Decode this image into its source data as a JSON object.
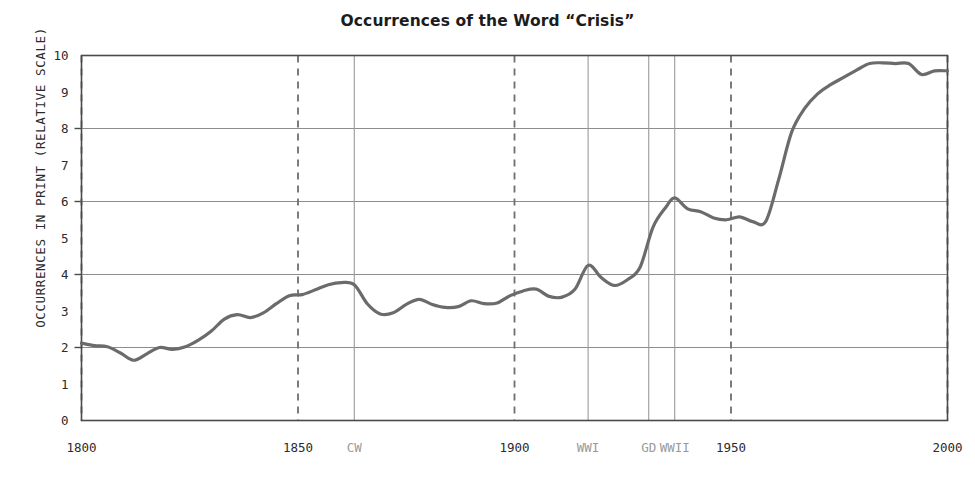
{
  "chart_data": {
    "type": "line",
    "title": "Occurrences of the Word “Crisis”",
    "xlabel": "",
    "ylabel": "OCCURRENCES IN PRINT (RELATIVE SCALE)",
    "xlim": [
      1800,
      2000
    ],
    "ylim": [
      0,
      10
    ],
    "grid": "horizontal-major",
    "legend": "none",
    "line_color": "#6b6b6b",
    "x_tick_labels": [
      "1800",
      "1850",
      "1900",
      "1950",
      "2000"
    ],
    "x_tick_values": [
      1800,
      1850,
      1900,
      1950,
      2000
    ],
    "y_tick_labels": [
      "0",
      "1",
      "2",
      "3",
      "4",
      "5",
      "6",
      "7",
      "8",
      "9",
      "10"
    ],
    "y_tick_values": [
      0,
      1,
      2,
      3,
      4,
      5,
      6,
      7,
      8,
      9,
      10
    ],
    "y_gridline_values": [
      2,
      4,
      6,
      8,
      10
    ],
    "year_markers": [
      {
        "label": "1800",
        "year": 1800,
        "style": "dashed"
      },
      {
        "label": "1850",
        "year": 1850,
        "style": "dashed"
      },
      {
        "label": "1900",
        "year": 1900,
        "style": "dashed"
      },
      {
        "label": "1950",
        "year": 1950,
        "style": "dashed"
      },
      {
        "label": "2000",
        "year": 2000,
        "style": "dashed"
      }
    ],
    "event_markers": [
      {
        "label": "CW",
        "year": 1863,
        "style": "solid"
      },
      {
        "label": "WWI",
        "year": 1917,
        "style": "solid"
      },
      {
        "label": "GD",
        "year": 1931,
        "style": "solid"
      },
      {
        "label": "WWII",
        "year": 1937,
        "style": "solid"
      }
    ],
    "x": [
      1800,
      1803,
      1806,
      1809,
      1812,
      1815,
      1818,
      1821,
      1824,
      1827,
      1830,
      1833,
      1836,
      1839,
      1842,
      1845,
      1848,
      1851,
      1854,
      1857,
      1860,
      1863,
      1866,
      1869,
      1872,
      1875,
      1878,
      1881,
      1884,
      1887,
      1890,
      1893,
      1896,
      1899,
      1902,
      1905,
      1908,
      1911,
      1914,
      1917,
      1920,
      1923,
      1926,
      1929,
      1932,
      1935,
      1937,
      1940,
      1943,
      1946,
      1949,
      1952,
      1955,
      1958,
      1961,
      1964,
      1967,
      1970,
      1973,
      1976,
      1979,
      1982,
      1985,
      1988,
      1991,
      1994,
      1997,
      2000
    ],
    "values": [
      2.12,
      2.05,
      2.02,
      1.85,
      1.65,
      1.82,
      2.0,
      1.95,
      2.02,
      2.2,
      2.45,
      2.78,
      2.9,
      2.82,
      2.95,
      3.2,
      3.42,
      3.45,
      3.58,
      3.72,
      3.78,
      3.72,
      3.2,
      2.92,
      2.95,
      3.18,
      3.32,
      3.18,
      3.1,
      3.12,
      3.28,
      3.2,
      3.22,
      3.42,
      3.55,
      3.6,
      3.4,
      3.38,
      3.6,
      4.25,
      3.92,
      3.7,
      3.85,
      4.2,
      5.3,
      5.85,
      6.1,
      5.8,
      5.72,
      5.55,
      5.5,
      5.58,
      5.45,
      5.45,
      6.6,
      7.9,
      8.55,
      8.95,
      9.2,
      9.4,
      9.6,
      9.78,
      9.8,
      9.78,
      9.78,
      9.48,
      9.58,
      9.58
    ]
  }
}
